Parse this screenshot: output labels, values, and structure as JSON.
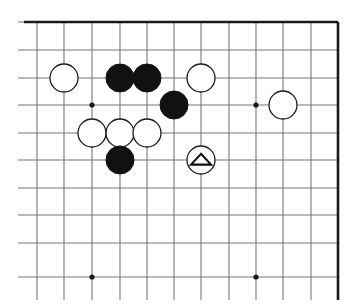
{
  "figure": {
    "kind": "go-board-diagram",
    "width": 359,
    "height": 307,
    "background_color": "#ffffff"
  },
  "board": {
    "description": "Partial go board showing the upper-right area; top and right edges are the board borders, left and bottom are cropped.",
    "grid_line_color": "#777777",
    "edge_line_color": "#1a1a1a",
    "grid_spacing_x": 27.3,
    "grid_spacing_y": 27.5,
    "vertical_lines_x": [
      37,
      64,
      92,
      120,
      147,
      174,
      201,
      229,
      256,
      283,
      311,
      338
    ],
    "horizontal_lines_y": [
      22,
      50,
      78,
      105,
      133,
      160,
      188,
      215,
      243,
      277
    ],
    "edges": [
      {
        "name": "top-border",
        "x1": 24,
        "y1": 22,
        "x2": 338,
        "y2": 22
      },
      {
        "name": "right-border",
        "x1": 338,
        "y1": 22,
        "x2": 338,
        "y2": 300
      }
    ],
    "star_points": [
      {
        "name": "star-point-upper-left",
        "x": 92,
        "y": 105,
        "radius": 2.6
      },
      {
        "name": "star-point-upper-right",
        "x": 256,
        "y": 105,
        "radius": 2.6
      },
      {
        "name": "star-point-lower-left",
        "x": 92,
        "y": 277,
        "radius": 2.6
      },
      {
        "name": "star-point-lower-right",
        "x": 256,
        "y": 277,
        "radius": 2.6
      }
    ]
  },
  "stones": {
    "radius": 14,
    "black_color": "#111111",
    "white_color": "#ffffff",
    "white_outline_color": "#1a1a1a",
    "items": [
      {
        "id": "w1",
        "color": "white",
        "x": 64,
        "y": 78,
        "marker": "none"
      },
      {
        "id": "b1",
        "color": "black",
        "x": 120,
        "y": 78,
        "marker": "none"
      },
      {
        "id": "b2",
        "color": "black",
        "x": 147,
        "y": 78,
        "marker": "none"
      },
      {
        "id": "w2",
        "color": "white",
        "x": 201,
        "y": 78,
        "marker": "none"
      },
      {
        "id": "b3",
        "color": "black",
        "x": 174,
        "y": 105,
        "marker": "none"
      },
      {
        "id": "w3",
        "color": "white",
        "x": 283,
        "y": 105,
        "marker": "none"
      },
      {
        "id": "w4",
        "color": "white",
        "x": 92,
        "y": 133,
        "marker": "none"
      },
      {
        "id": "w5",
        "color": "white",
        "x": 120,
        "y": 133,
        "marker": "none"
      },
      {
        "id": "w6",
        "color": "white",
        "x": 147,
        "y": 133,
        "marker": "none"
      },
      {
        "id": "b4",
        "color": "black",
        "x": 120,
        "y": 160,
        "marker": "none"
      },
      {
        "id": "w7",
        "color": "white",
        "x": 201,
        "y": 160,
        "marker": "triangle"
      }
    ]
  },
  "markers": {
    "triangle": {
      "name": "triangle-marker",
      "meaning": "marked stone",
      "glyph": "triangle",
      "stroke_color": "#111111",
      "on_stone_id": "w7"
    }
  }
}
